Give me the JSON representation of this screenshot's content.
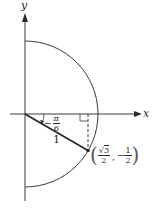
{
  "diagram": {
    "type": "unit-circle-half",
    "colors": {
      "line": "#3a3a3a",
      "background": "#ffffff"
    },
    "axes": {
      "x_label": "x",
      "y_label": "y"
    },
    "angle": {
      "sign": "−",
      "numerator": "π",
      "denominator": "6"
    },
    "radius_label": "1",
    "point": {
      "x_num_radical": "3",
      "x_num_root": "√",
      "x_den": "2",
      "separator": ",",
      "y_sign": "−",
      "y_num": "1",
      "y_den": "2",
      "open_paren": "(",
      "close_paren": ")"
    }
  }
}
